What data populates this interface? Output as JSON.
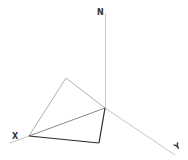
{
  "diagram": {
    "type": "3d-axes-with-pyramid-wireframe",
    "axes": {
      "z_label": "N",
      "x_label": "X",
      "y_label": "Y"
    },
    "colors": {
      "axis": "#b0b0b0",
      "faint_edge": "#9a9a9a",
      "bold_edge": "#2a2a2a",
      "label": "#333333",
      "background": "#ffffff"
    }
  }
}
